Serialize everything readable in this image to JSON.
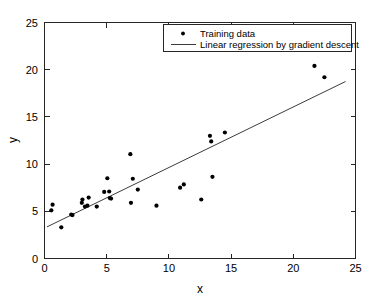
{
  "figure": {
    "background_color": "#ffffff",
    "axes_color": "#262626",
    "point_color": "#000000",
    "line_color": "#3b3b3b"
  },
  "chart_data": {
    "type": "scatter",
    "title": "",
    "xlabel": "x",
    "ylabel": "y",
    "xlim": [
      0,
      25
    ],
    "ylim": [
      0,
      25
    ],
    "xticks": [
      0,
      5,
      10,
      15,
      20,
      25
    ],
    "yticks": [
      0,
      5,
      10,
      15,
      20,
      25
    ],
    "xtick_labels": [
      "0",
      "5",
      "10",
      "15",
      "20",
      "25"
    ],
    "ytick_labels": [
      "0",
      "5",
      "10",
      "15",
      "20",
      "25"
    ],
    "grid": false,
    "legend_position": "top-right",
    "series": [
      {
        "name": "Training data",
        "type": "scatter",
        "marker": "circle",
        "color": "#000000",
        "points": [
          [
            0.55,
            5.1
          ],
          [
            0.65,
            5.7
          ],
          [
            1.35,
            3.3
          ],
          [
            2.15,
            4.65
          ],
          [
            2.25,
            4.6
          ],
          [
            3.0,
            5.9
          ],
          [
            3.05,
            6.25
          ],
          [
            3.25,
            5.5
          ],
          [
            3.45,
            5.6
          ],
          [
            3.55,
            6.45
          ],
          [
            4.2,
            5.5
          ],
          [
            4.8,
            7.05
          ],
          [
            5.2,
            7.1
          ],
          [
            5.05,
            8.5
          ],
          [
            5.25,
            6.4
          ],
          [
            5.35,
            6.35
          ],
          [
            6.9,
            11.05
          ],
          [
            6.95,
            5.9
          ],
          [
            7.1,
            8.45
          ],
          [
            7.5,
            7.3
          ],
          [
            9.0,
            5.6
          ],
          [
            10.9,
            7.5
          ],
          [
            11.2,
            7.85
          ],
          [
            12.6,
            6.25
          ],
          [
            13.3,
            13.0
          ],
          [
            13.4,
            12.4
          ],
          [
            13.5,
            8.65
          ],
          [
            14.5,
            13.35
          ],
          [
            21.7,
            20.4
          ],
          [
            22.5,
            19.2
          ]
        ]
      },
      {
        "name": "Linear regression by gradient descent",
        "type": "line",
        "color": "#3b3b3b",
        "endpoints": [
          [
            0.2,
            3.35
          ],
          [
            24.2,
            18.75
          ]
        ],
        "slope": 0.642,
        "intercept": 3.22
      }
    ]
  },
  "legend": {
    "entries": [
      {
        "label": "Training data",
        "marker": "circle"
      },
      {
        "label": "Linear regression by gradient descent",
        "marker": "line"
      }
    ]
  }
}
